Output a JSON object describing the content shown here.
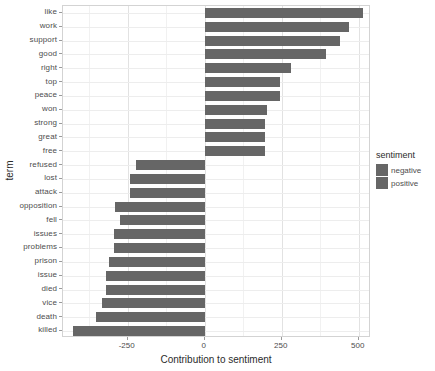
{
  "chart_data": {
    "type": "bar",
    "orientation": "horizontal",
    "title": "",
    "xlabel": "Contribution to sentiment",
    "ylabel": "term",
    "xlim": [
      -460,
      540
    ],
    "xticks": [
      -250,
      0,
      250,
      500
    ],
    "xtick_labels": [
      "-250",
      "0",
      "250",
      "500"
    ],
    "grid": true,
    "grid_minor_x": [
      -375,
      -125,
      125,
      375
    ],
    "legend": {
      "title": "sentiment",
      "position": "right",
      "entries": [
        {
          "label": "negative",
          "color": "#666666"
        },
        {
          "label": "positive",
          "color": "#666666"
        }
      ]
    },
    "categories": [
      "like",
      "work",
      "support",
      "good",
      "right",
      "top",
      "peace",
      "won",
      "strong",
      "great",
      "free",
      "refused",
      "lost",
      "attack",
      "opposition",
      "fell",
      "issues",
      "problems",
      "prison",
      "issue",
      "died",
      "vice",
      "death",
      "killed"
    ],
    "values": [
      515,
      467,
      438,
      395,
      279,
      245,
      245,
      201,
      196,
      196,
      196,
      -223,
      -243,
      -243,
      -291,
      -274,
      -294,
      -294,
      -311,
      -322,
      -322,
      -333,
      -353,
      -429
    ],
    "sentiments": [
      "positive",
      "positive",
      "positive",
      "positive",
      "positive",
      "positive",
      "positive",
      "positive",
      "positive",
      "positive",
      "positive",
      "negative",
      "negative",
      "negative",
      "negative",
      "negative",
      "negative",
      "negative",
      "negative",
      "negative",
      "negative",
      "negative",
      "negative",
      "negative"
    ],
    "bar_color": "#666666",
    "panel_background": "#ffffff",
    "gridline_color": "#e2e2e2"
  }
}
